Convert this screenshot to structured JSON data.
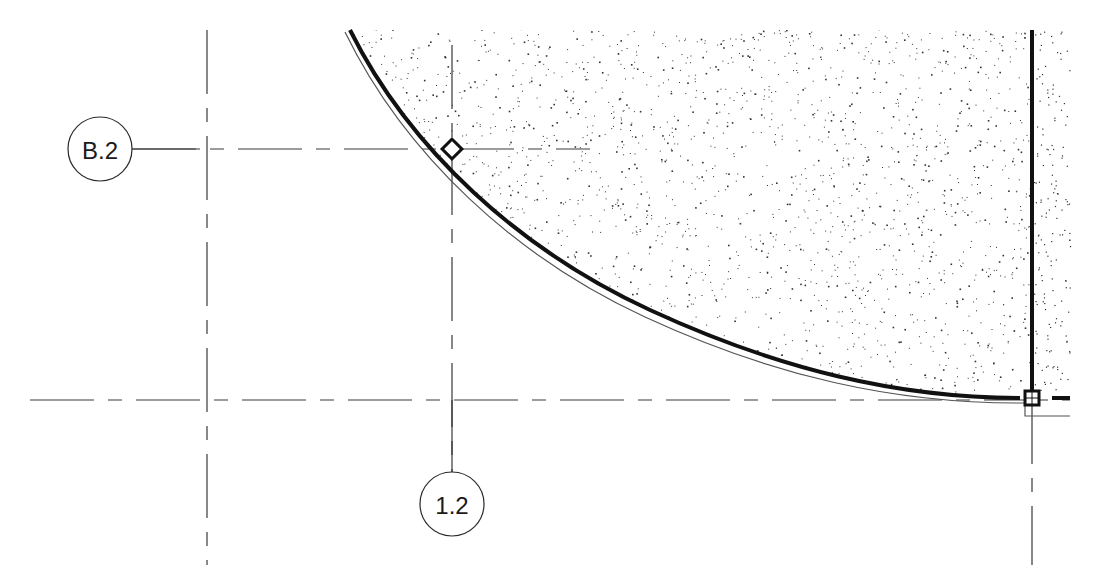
{
  "drawing": {
    "type": "floor-plan",
    "background_color": "#ffffff",
    "line_color": "#3a3a3a",
    "edge_color": "#111111",
    "grid_bubbles": [
      {
        "id": "B.2",
        "label": "B.2",
        "orientation": "horizontal-grid",
        "cx": 100,
        "cy": 149,
        "r": 32
      },
      {
        "id": "1.2",
        "label": "1.2",
        "orientation": "vertical-grid",
        "cx": 452,
        "cy": 504,
        "r": 32
      }
    ],
    "grid_lines": [
      {
        "name": "grid-B.2",
        "x1": 132,
        "y1": 149,
        "x2": 590,
        "y2": 149
      },
      {
        "name": "grid-horizontal-lower",
        "x1": 30,
        "y1": 400,
        "x2": 1070,
        "y2": 400
      },
      {
        "name": "grid-vertical-left",
        "x1": 207,
        "y1": 30,
        "x2": 207,
        "y2": 565
      },
      {
        "name": "grid-1.2",
        "x1": 452,
        "y1": 45,
        "x2": 452,
        "y2": 472
      },
      {
        "name": "grid-vertical-right",
        "x1": 1032,
        "y1": 380,
        "x2": 1032,
        "y2": 565
      }
    ],
    "slab": {
      "fill_pattern": "stipple",
      "curve_start": {
        "x": 350,
        "y": 30
      },
      "curve_end": {
        "x": 1020,
        "y": 398
      },
      "right_edge_x": 1032
    },
    "markers": [
      {
        "name": "diamond-snap-marker",
        "shape": "diamond",
        "x": 452,
        "y": 149,
        "size": 14
      },
      {
        "name": "square-endpoint-marker",
        "shape": "square",
        "x": 1032,
        "y": 398,
        "size": 14
      }
    ]
  }
}
